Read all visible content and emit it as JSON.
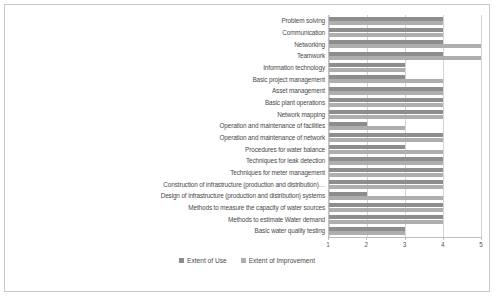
{
  "chart_data": {
    "type": "bar",
    "orientation": "horizontal",
    "title": "",
    "xlabel": "",
    "ylabel": "",
    "xlim": [
      1,
      5
    ],
    "xticks": [
      "1",
      "2",
      "3",
      "4",
      "5"
    ],
    "grid": true,
    "legend_position": "bottom",
    "categories": [
      "Problem solving",
      "Communication",
      "Networking",
      "Teamwork",
      "Information technology",
      "Basic project management",
      "Asset management",
      "Basic plant operations",
      "Network mapping",
      "Operation and maintenance of facilities",
      "Operation and maintenance of network",
      "Procedures for water balance",
      "Techniques  for leak detection",
      "Techniques for meter management",
      "Construction of infrastructure (production and distribution)…",
      "Design of infrastructure (production and distribution) systems",
      "Methods to measure the capacity of water sources",
      "Methods to estimate Water demand",
      "Basic water quality testing"
    ],
    "series": [
      {
        "name": "Extent of Use",
        "color": "#8d8d8d",
        "values": [
          4,
          4,
          4,
          4,
          3,
          3,
          4,
          4,
          4,
          2,
          4,
          3,
          4,
          4,
          4,
          2,
          4,
          4,
          3
        ]
      },
      {
        "name": "Extent of Improvement",
        "color": "#aeaeae",
        "values": [
          4,
          4,
          5,
          5,
          3,
          4,
          4,
          4,
          4,
          3,
          4,
          4,
          4,
          4,
          4,
          4,
          4,
          4,
          3
        ]
      }
    ]
  },
  "legend": {
    "items": [
      {
        "label": "Extent of Use",
        "key": "use"
      },
      {
        "label": "Extent of Improvement",
        "key": "improve"
      }
    ]
  }
}
